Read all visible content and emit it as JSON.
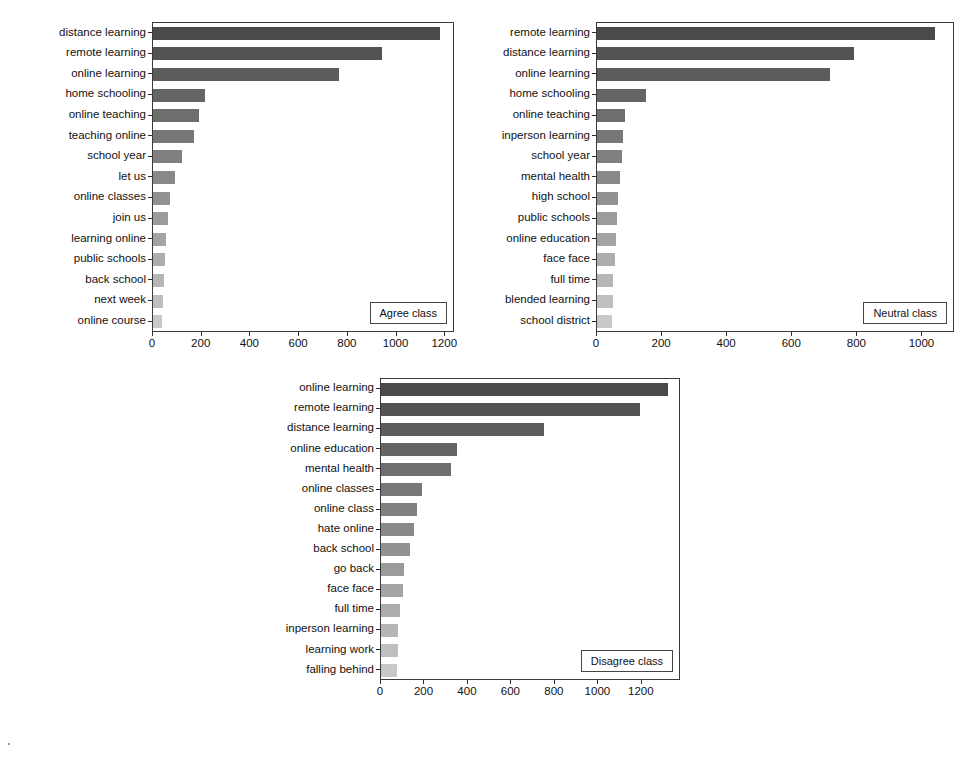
{
  "figure": {
    "background": "#ffffff",
    "bar_color_dark": "#4a4a4a",
    "bar_color_light": "#c6c6c6"
  },
  "chart_data": [
    {
      "type": "bar",
      "orientation": "horizontal",
      "title": "",
      "legend_label": "Agree class",
      "legend_position": "lower-right",
      "xlabel": "",
      "ylabel": "",
      "grid": false,
      "xlim": [
        0,
        1240
      ],
      "xticks": [
        0,
        200,
        400,
        600,
        800,
        1000,
        1200
      ],
      "xticklabels": [
        "0",
        "200",
        "400",
        "600",
        "800",
        "1000",
        "1200"
      ],
      "categories": [
        "distance learning",
        "remote learning",
        "online learning",
        "home schooling",
        "online teaching",
        "teaching online",
        "school year",
        "let us",
        "online classes",
        "join us",
        "learning online",
        "public schools",
        "back school",
        "next week",
        "online course"
      ],
      "values": [
        1180,
        940,
        765,
        215,
        190,
        170,
        120,
        90,
        70,
        60,
        52,
        48,
        45,
        42,
        38
      ]
    },
    {
      "type": "bar",
      "orientation": "horizontal",
      "title": "",
      "legend_label": "Neutral class",
      "legend_position": "lower-right",
      "xlabel": "",
      "ylabel": "",
      "grid": false,
      "xlim": [
        0,
        1100
      ],
      "xticks": [
        0,
        200,
        400,
        600,
        800,
        1000
      ],
      "xticklabels": [
        "0",
        "200",
        "400",
        "600",
        "800",
        "1000"
      ],
      "categories": [
        "remote learning",
        "distance learning",
        "online learning",
        "home schooling",
        "online teaching",
        "inperson learning",
        "school year",
        "mental health",
        "high school",
        "public schools",
        "online education",
        "face face",
        "full time",
        "blended learning",
        "school district"
      ],
      "values": [
        1040,
        790,
        715,
        150,
        85,
        80,
        77,
        70,
        66,
        62,
        58,
        54,
        50,
        48,
        45
      ]
    },
    {
      "type": "bar",
      "orientation": "horizontal",
      "title": "",
      "legend_label": "Disagree class",
      "legend_position": "lower-right",
      "xlabel": "",
      "ylabel": "",
      "grid": false,
      "xlim": [
        0,
        1380
      ],
      "xticks": [
        0,
        200,
        400,
        600,
        800,
        1000,
        1200
      ],
      "xticklabels": [
        "0",
        "200",
        "400",
        "600",
        "800",
        "1000",
        "1200"
      ],
      "categories": [
        "online learning",
        "remote learning",
        "distance learning",
        "online education",
        "mental health",
        "online classes",
        "online class",
        "hate online",
        "back school",
        "go back",
        "face face",
        "full time",
        "inperson learning",
        "learning work",
        "falling behind"
      ],
      "values": [
        1320,
        1190,
        750,
        350,
        320,
        190,
        165,
        150,
        135,
        105,
        100,
        88,
        80,
        78,
        72
      ]
    }
  ]
}
